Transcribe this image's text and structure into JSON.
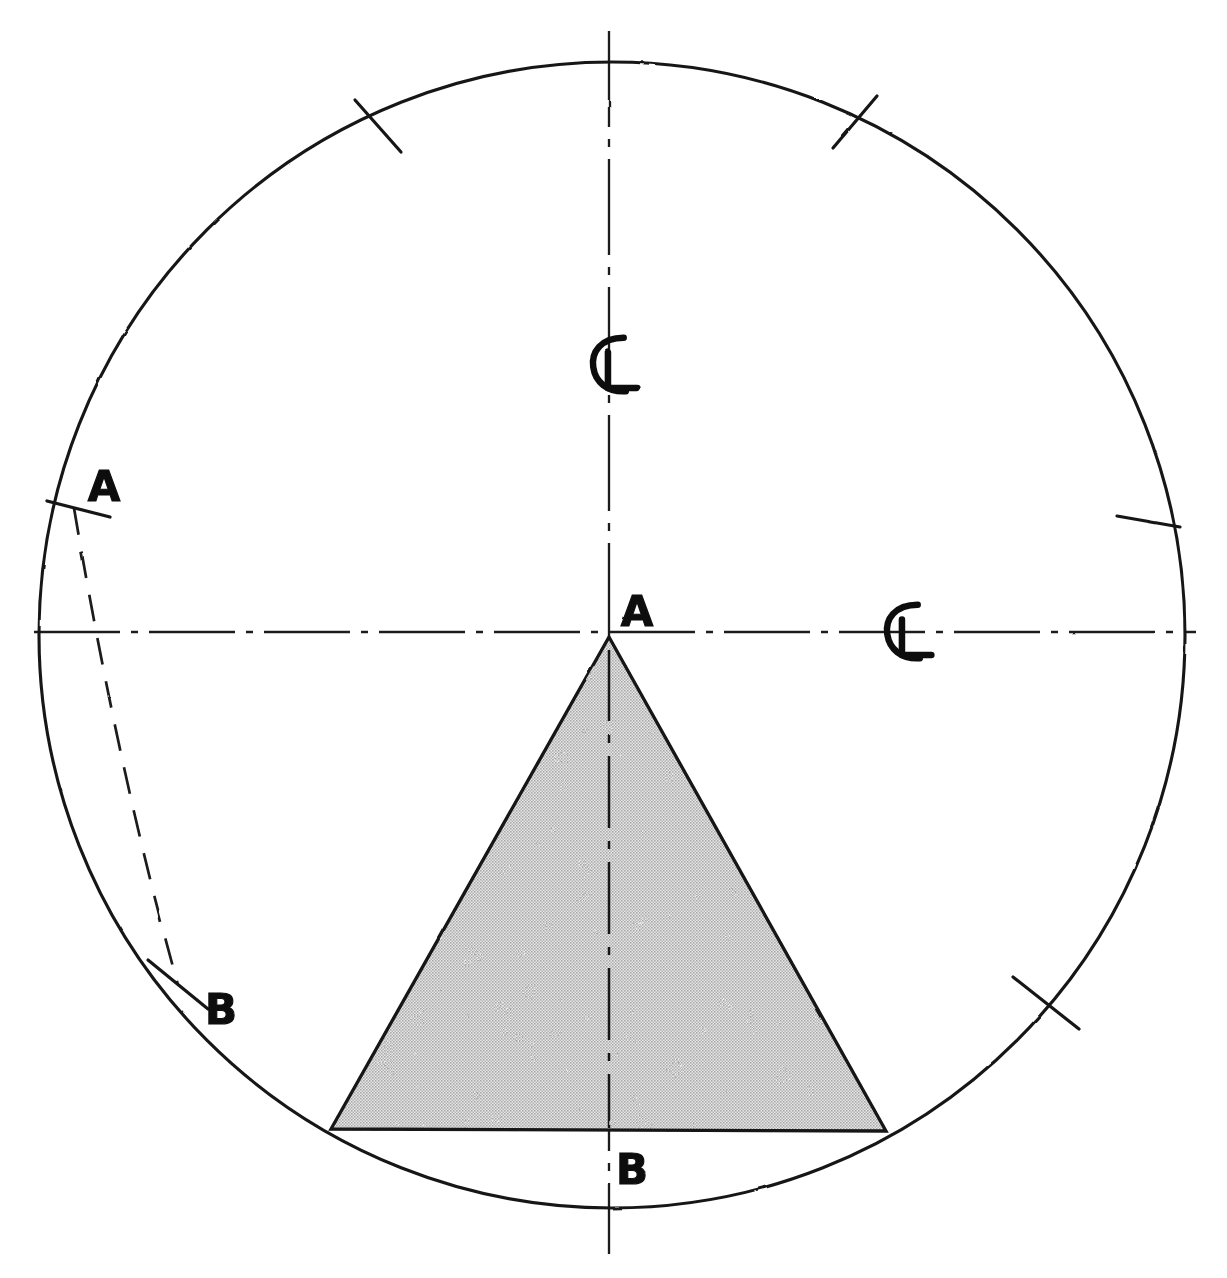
{
  "drawing": {
    "title": "Circle with inscribed triangle and chord layout",
    "background_color": "#ffffff",
    "ink_color": "#161616",
    "fill_color": "#c9c9c9",
    "canvas": {
      "width": 1227,
      "height": 1278
    }
  },
  "geometry": {
    "circle": {
      "cx": 612,
      "cy": 635,
      "r": 573,
      "line": "solid"
    },
    "centerline_horizontal": {
      "x1": 34,
      "y1": 632,
      "x2": 1196,
      "y2": 632,
      "line": "dash-dot"
    },
    "centerline_vertical": {
      "x1": 609,
      "y1": 31,
      "x2": 609,
      "y2": 1254,
      "line": "dash-dot"
    },
    "triangle": {
      "apex": {
        "x": 609,
        "y": 637
      },
      "base_left": {
        "x": 331,
        "y": 1129
      },
      "base_right": {
        "x": 886,
        "y": 1131
      },
      "fill": "stipple-grey"
    },
    "triangle_centerline": {
      "x1": 609,
      "y1": 650,
      "x2": 609,
      "y2": 1128,
      "line": "dash-dot"
    },
    "chord_dashed": {
      "from": "A",
      "to": "B",
      "start": {
        "x": 74,
        "y": 508
      },
      "control": {
        "x": 118,
        "y": 770
      },
      "end": {
        "x": 178,
        "y": 985
      },
      "line": "dashed"
    },
    "tick_marks": [
      {
        "name": "tick-upper-left",
        "x": 378,
        "y": 126,
        "angle": -62
      },
      {
        "name": "tick-upper-right",
        "x": 855,
        "y": 122,
        "angle": 62
      },
      {
        "name": "tick-right-middle",
        "x": 1148,
        "y": 521,
        "angle": 10
      },
      {
        "name": "tick-lower-right",
        "x": 1046,
        "y": 1003,
        "angle": -44
      },
      {
        "name": "tick-point-a-left",
        "x": 74,
        "y": 508,
        "angle": 12
      },
      {
        "name": "tick-point-b-left",
        "x": 178,
        "y": 985,
        "angle": 42
      }
    ]
  },
  "labels": [
    {
      "name": "label-a-left",
      "text": "A",
      "x": 104,
      "y": 489,
      "size": 42
    },
    {
      "name": "label-b-left",
      "text": "B",
      "x": 221,
      "y": 1012,
      "size": 42
    },
    {
      "name": "label-a-apex",
      "text": "A",
      "x": 637,
      "y": 614,
      "size": 42
    },
    {
      "name": "label-b-base",
      "text": "B",
      "x": 632,
      "y": 1172,
      "size": 42
    }
  ],
  "centerline_symbols": [
    {
      "name": "centerline-symbol-vertical",
      "x": 609,
      "y": 365,
      "label": "CL"
    },
    {
      "name": "centerline-symbol-horizontal",
      "x": 903,
      "y": 632,
      "label": "CL"
    }
  ],
  "legend": {
    "solid_line": "object / circle outline",
    "dash_dot_line": "centerline",
    "dashed_line": "hidden / construction arc",
    "stipple_fill": "sectioned area"
  }
}
